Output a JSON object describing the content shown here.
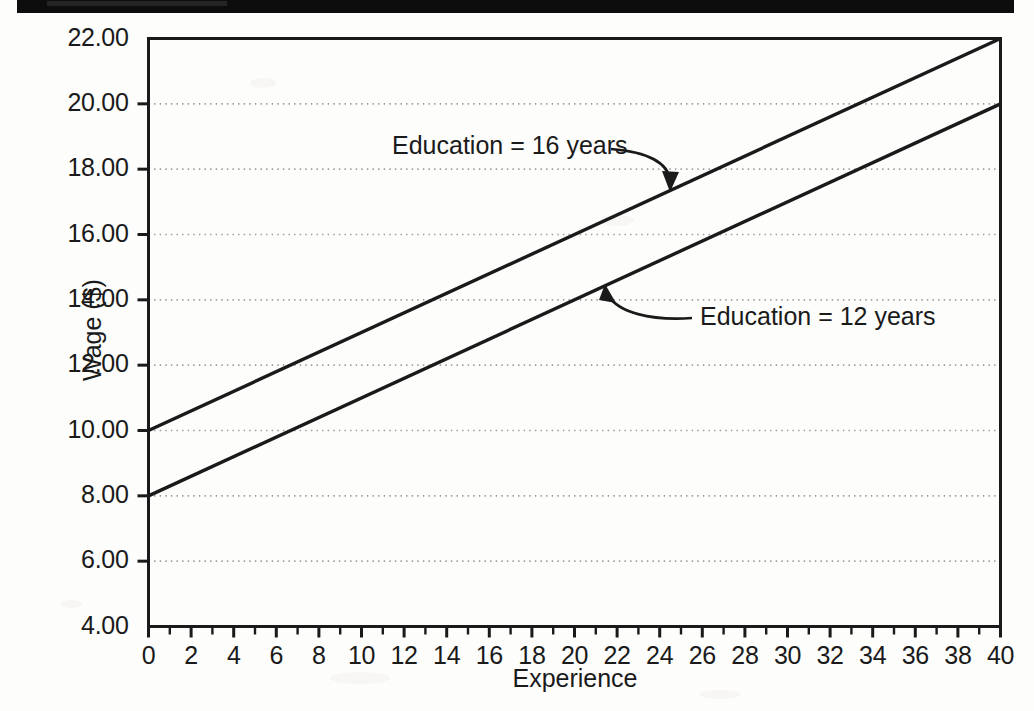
{
  "figure": {
    "background_color": "#fdfdfc",
    "ink_color": "#1a1a1a",
    "grid_color": "#9a9a9a",
    "scan_artifact_color": "#0d0d0d"
  },
  "axes": {
    "y_title": "Wage ($)",
    "x_title": "Experience",
    "y_ticks": [
      "22.00",
      "20.00",
      "18.00",
      "16.00",
      "14.00",
      "12.00",
      "10.00",
      "8.00",
      "6.00",
      "4.00"
    ],
    "x_ticks": [
      "0",
      "2",
      "4",
      "6",
      "8",
      "10",
      "12",
      "14",
      "16",
      "18",
      "20",
      "22",
      "24",
      "26",
      "28",
      "30",
      "32",
      "34",
      "36",
      "38",
      "40"
    ]
  },
  "annotations": {
    "upper_label": "Education = 16 years",
    "lower_label": "Education = 12 years"
  },
  "chart_data": {
    "type": "line",
    "title": "",
    "subtitle": "",
    "xlabel": "Experience",
    "ylabel": "Wage ($)",
    "xlim": [
      0,
      40
    ],
    "ylim": [
      4.0,
      22.0
    ],
    "xticks": [
      0,
      2,
      4,
      6,
      8,
      10,
      12,
      14,
      16,
      18,
      20,
      22,
      24,
      26,
      28,
      30,
      32,
      34,
      36,
      38,
      40
    ],
    "yticks": [
      4.0,
      6.0,
      8.0,
      10.0,
      12.0,
      14.0,
      16.0,
      18.0,
      20.0,
      22.0
    ],
    "grid": "horizontal dotted gridlines only",
    "legend": "none (inline arrow annotations)",
    "x": [
      0,
      40
    ],
    "series": [
      {
        "name": "Education = 16 years",
        "values": [
          10.0,
          22.0
        ],
        "intercept": 10.0,
        "slope_per_year": 0.3,
        "style": "solid black line",
        "annotation": {
          "label": "Education = 16 years",
          "label_x": 12,
          "label_y": 18.3,
          "arrow_points_to_x": 25,
          "arrow_points_to_y": 17.5
        }
      },
      {
        "name": "Education = 12 years",
        "values": [
          8.0,
          20.0
        ],
        "intercept": 8.0,
        "slope_per_year": 0.3,
        "style": "solid black line",
        "annotation": {
          "label": "Education = 12 years",
          "label_x": 27,
          "label_y": 13.5,
          "arrow_points_to_x": 21.5,
          "arrow_points_to_y": 14.5
        }
      }
    ]
  }
}
